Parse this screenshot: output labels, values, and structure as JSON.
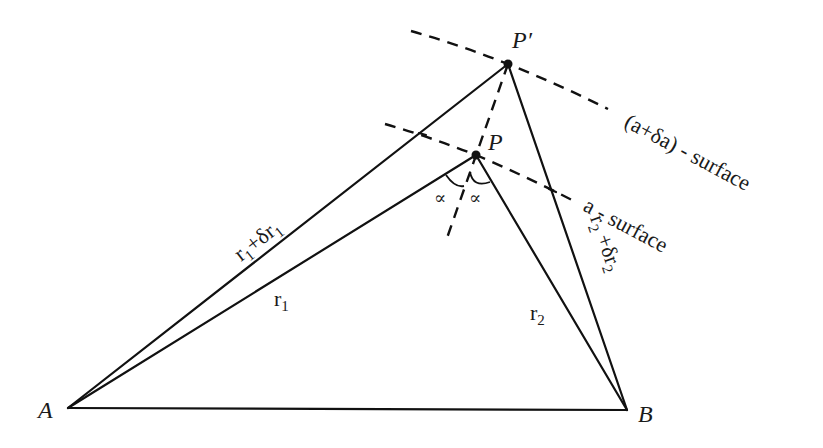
{
  "diagram": {
    "points": {
      "A": {
        "label": "A",
        "x": 68,
        "y": 408
      },
      "B": {
        "label": "B",
        "x": 627,
        "y": 410
      },
      "P": {
        "label": "P",
        "x": 476,
        "y": 155
      },
      "P_prime": {
        "label": "P′",
        "x": 508,
        "y": 64
      }
    },
    "edges": {
      "r1": "r",
      "r1_sub": "1",
      "r2": "r",
      "r2_sub": "2",
      "r1_plus": "r",
      "r1_plus_sub": "1",
      "r1_plus_mid": "+δr",
      "r1_plus_sub2": "1",
      "r2_plus": "r",
      "r2_plus_sub": "2",
      "r2_plus_mid": " +δr",
      "r2_plus_sub2": "2"
    },
    "angles": {
      "left": "∝",
      "right": "∝"
    },
    "surfaces": {
      "outer": "(a+δa) - surface",
      "inner": "a - surface"
    },
    "colors": {
      "ink": "#111111",
      "background": "#ffffff"
    }
  }
}
